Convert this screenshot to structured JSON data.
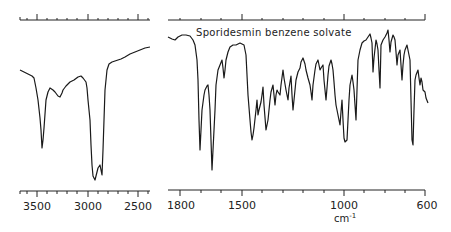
{
  "chart_data": {
    "type": "line",
    "title": "Sporidesmin benzene solvate",
    "xlabel": "cm-1",
    "ylabel": "",
    "grid": false,
    "legend": null,
    "line_color": "#1a1a1a",
    "panels": [
      {
        "name": "left-panel",
        "xlim": [
          3700,
          2450
        ],
        "ticks": [
          {
            "value": 3500,
            "label": "3500"
          },
          {
            "value": 3000,
            "label": "3000"
          },
          {
            "value": 2500,
            "label": "2500"
          }
        ],
        "points_px": [
          [
            20,
            70
          ],
          [
            24,
            72
          ],
          [
            28,
            74
          ],
          [
            32,
            76
          ],
          [
            34,
            78
          ],
          [
            36,
            88
          ],
          [
            38,
            100
          ],
          [
            40,
            118
          ],
          [
            41,
            130
          ],
          [
            42,
            148
          ],
          [
            43,
            140
          ],
          [
            44,
            128
          ],
          [
            46,
            100
          ],
          [
            48,
            92
          ],
          [
            50,
            88
          ],
          [
            53,
            90
          ],
          [
            55,
            92
          ],
          [
            58,
            96
          ],
          [
            60,
            97
          ],
          [
            62,
            93
          ],
          [
            63,
            90
          ],
          [
            66,
            86
          ],
          [
            70,
            82
          ],
          [
            74,
            80
          ],
          [
            78,
            77
          ],
          [
            81,
            76
          ],
          [
            83,
            78
          ],
          [
            86,
            82
          ],
          [
            87,
            88
          ],
          [
            88,
            100
          ],
          [
            90,
            120
          ],
          [
            91,
            145
          ],
          [
            92,
            165
          ],
          [
            93,
            176
          ],
          [
            95,
            180
          ],
          [
            96,
            176
          ],
          [
            98,
            168
          ],
          [
            100,
            165
          ],
          [
            101,
            170
          ],
          [
            102,
            175
          ],
          [
            103,
            150
          ],
          [
            104,
            120
          ],
          [
            105,
            90
          ],
          [
            107,
            70
          ],
          [
            109,
            64
          ],
          [
            112,
            62
          ],
          [
            115,
            61
          ],
          [
            118,
            60
          ],
          [
            121,
            59
          ],
          [
            125,
            57
          ],
          [
            130,
            54
          ],
          [
            135,
            52
          ],
          [
            140,
            50
          ],
          [
            145,
            48
          ],
          [
            150,
            47
          ]
        ]
      },
      {
        "name": "right-panel",
        "xlim": [
          1850,
          590
        ],
        "ticks": [
          {
            "value": 1800,
            "label": "1800"
          },
          {
            "value": 1500,
            "label": "1500"
          },
          {
            "value": 1000,
            "label": "1000"
          },
          {
            "value": 600,
            "label": "600"
          }
        ],
        "points_px": [
          [
            168,
            37
          ],
          [
            172,
            39
          ],
          [
            175,
            40
          ],
          [
            178,
            37
          ],
          [
            182,
            35
          ],
          [
            186,
            35
          ],
          [
            190,
            36
          ],
          [
            193,
            40
          ],
          [
            195,
            45
          ],
          [
            197,
            60
          ],
          [
            198,
            80
          ],
          [
            199,
            120
          ],
          [
            200,
            150
          ],
          [
            201,
            130
          ],
          [
            202,
            110
          ],
          [
            204,
            95
          ],
          [
            205,
            90
          ],
          [
            207,
            86
          ],
          [
            208,
            85
          ],
          [
            209,
            95
          ],
          [
            210,
            110
          ],
          [
            211,
            140
          ],
          [
            212,
            170
          ],
          [
            213,
            150
          ],
          [
            215,
            110
          ],
          [
            216,
            85
          ],
          [
            218,
            70
          ],
          [
            220,
            65
          ],
          [
            222,
            60
          ],
          [
            223,
            68
          ],
          [
            224,
            78
          ],
          [
            225,
            70
          ],
          [
            226,
            60
          ],
          [
            228,
            52
          ],
          [
            230,
            47
          ],
          [
            233,
            45
          ],
          [
            236,
            45
          ],
          [
            240,
            43
          ],
          [
            242,
            44
          ],
          [
            244,
            45
          ],
          [
            246,
            55
          ],
          [
            247,
            75
          ],
          [
            248,
            95
          ],
          [
            250,
            120
          ],
          [
            251,
            132
          ],
          [
            252,
            140
          ],
          [
            253,
            135
          ],
          [
            254,
            128
          ],
          [
            256,
            110
          ],
          [
            257,
            100
          ],
          [
            258,
            115
          ],
          [
            259,
            110
          ],
          [
            261,
            102
          ],
          [
            262,
            95
          ],
          [
            263,
            87
          ],
          [
            264,
            105
          ],
          [
            266,
            130
          ],
          [
            267,
            125
          ],
          [
            268,
            120
          ],
          [
            269,
            110
          ],
          [
            270,
            100
          ],
          [
            271,
            92
          ],
          [
            273,
            85
          ],
          [
            274,
            95
          ],
          [
            275,
            105
          ],
          [
            276,
            95
          ],
          [
            277,
            90
          ],
          [
            278,
            92
          ],
          [
            280,
            95
          ],
          [
            281,
            85
          ],
          [
            283,
            70
          ],
          [
            284,
            78
          ],
          [
            286,
            90
          ],
          [
            287,
            95
          ],
          [
            288,
            100
          ],
          [
            289,
            88
          ],
          [
            291,
            76
          ],
          [
            292,
            95
          ],
          [
            293,
            110
          ],
          [
            294,
            100
          ],
          [
            296,
            80
          ],
          [
            298,
            72
          ],
          [
            300,
            68
          ],
          [
            301,
            62
          ],
          [
            303,
            58
          ],
          [
            305,
            64
          ],
          [
            306,
            70
          ],
          [
            308,
            78
          ],
          [
            310,
            85
          ],
          [
            311,
            92
          ],
          [
            312,
            100
          ],
          [
            313,
            85
          ],
          [
            315,
            70
          ],
          [
            316,
            64
          ],
          [
            318,
            60
          ],
          [
            319,
            65
          ],
          [
            320,
            70
          ],
          [
            321,
            68
          ],
          [
            323,
            65
          ],
          [
            324,
            80
          ],
          [
            326,
            100
          ],
          [
            327,
            88
          ],
          [
            328,
            75
          ],
          [
            329,
            66
          ],
          [
            331,
            60
          ],
          [
            332,
            64
          ],
          [
            333,
            70
          ],
          [
            334,
            82
          ],
          [
            335,
            95
          ],
          [
            336,
            105
          ],
          [
            338,
            115
          ],
          [
            339,
            120
          ],
          [
            340,
            125
          ],
          [
            341,
            112
          ],
          [
            342,
            100
          ],
          [
            343,
            120
          ],
          [
            344,
            138
          ],
          [
            345,
            142
          ],
          [
            347,
            140
          ],
          [
            348,
            120
          ],
          [
            349,
            100
          ],
          [
            350,
            85
          ],
          [
            352,
            75
          ],
          [
            353,
            82
          ],
          [
            354,
            90
          ],
          [
            355,
            105
          ],
          [
            356,
            120
          ],
          [
            357,
            90
          ],
          [
            358,
            60
          ],
          [
            360,
            50
          ],
          [
            362,
            43
          ],
          [
            364,
            41
          ],
          [
            366,
            40
          ],
          [
            368,
            37
          ],
          [
            370,
            34
          ],
          [
            371,
            38
          ],
          [
            372,
            43
          ],
          [
            373,
            72
          ],
          [
            374,
            58
          ],
          [
            376,
            40
          ],
          [
            377,
            44
          ],
          [
            378,
            50
          ],
          [
            379,
            70
          ],
          [
            380,
            88
          ],
          [
            381,
            45
          ],
          [
            383,
            40
          ],
          [
            385,
            37
          ],
          [
            387,
            33
          ],
          [
            388,
            30
          ],
          [
            389,
            40
          ],
          [
            390,
            52
          ],
          [
            391,
            42
          ],
          [
            393,
            35
          ],
          [
            394,
            37
          ],
          [
            395,
            40
          ],
          [
            396,
            52
          ],
          [
            397,
            65
          ],
          [
            398,
            55
          ],
          [
            400,
            50
          ],
          [
            401,
            65
          ],
          [
            402,
            80
          ],
          [
            403,
            65
          ],
          [
            404,
            55
          ],
          [
            405,
            50
          ],
          [
            407,
            45
          ],
          [
            408,
            50
          ],
          [
            410,
            60
          ],
          [
            411,
            100
          ],
          [
            412,
            140
          ],
          [
            413,
            145
          ],
          [
            414,
            110
          ],
          [
            415,
            80
          ],
          [
            416,
            75
          ],
          [
            418,
            70
          ],
          [
            419,
            78
          ],
          [
            420,
            85
          ],
          [
            421,
            78
          ],
          [
            422,
            82
          ],
          [
            423,
            90
          ],
          [
            425,
            92
          ],
          [
            426,
            98
          ],
          [
            428,
            103
          ]
        ]
      }
    ]
  },
  "labels": {
    "title": "Sporidesmin benzene solvate",
    "x_unit": "cm",
    "x_unit_exp": "-1",
    "left_ticks": [
      "3500",
      "3000",
      "2500"
    ],
    "right_ticks": [
      "1800",
      "1500",
      "1000",
      "600"
    ]
  }
}
